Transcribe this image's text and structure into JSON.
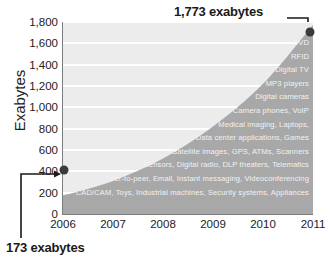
{
  "chart_data": {
    "type": "area",
    "title": "",
    "xlabel": "",
    "ylabel": "Exabytes",
    "x": [
      "2006",
      "2007",
      "2008",
      "2009",
      "2010",
      "2011"
    ],
    "categories": [
      "2006",
      "2007",
      "2008",
      "2009",
      "2010",
      "2011"
    ],
    "values": [
      173,
      310,
      520,
      820,
      1220,
      1773
    ],
    "series": [
      {
        "name": "Information created",
        "values": [
          173,
          310,
          520,
          820,
          1220,
          1773
        ]
      }
    ],
    "ylim": [
      0,
      1800
    ],
    "yticks": [
      0,
      200,
      400,
      600,
      800,
      1000,
      1200,
      1400,
      1600,
      1800
    ],
    "ytick_labels": [
      "0",
      "200",
      "400",
      "600",
      "800",
      "1,000",
      "1,200",
      "1,400",
      "1,600",
      "1,800"
    ],
    "grid": true,
    "legend": "none",
    "annotations": [
      {
        "text": "1,773 exabytes",
        "x": "2011",
        "y": 1773,
        "position": "top-right"
      },
      {
        "text": "173 exabytes",
        "x": "2006",
        "y": 173,
        "position": "bottom-left"
      }
    ],
    "inline_labels": [
      "DVD",
      "RFID",
      "Digital TV",
      "MP3 players",
      "Digital cameras",
      "Camera phones, VoIP",
      "Medical imaging, Laptops,",
      "Data center applications, Games",
      "Satellite images, GPS, ATMs, Scanners",
      "Sensors, Digital radio, DLP theaters, Telematics",
      "Peer-to-peer, Email, Instant messaging, Videoconferencing",
      "CAD/CAM, Toys, Industrial machines, Security systems, Appliances"
    ]
  },
  "colors": {
    "plot_background": "#ececed",
    "area_fill": "#a8a8a8",
    "gridline": "#ffffff",
    "axis": "#7d7d7d",
    "data_point": "#3a3a3a",
    "annotation_text": "#1a1a1a",
    "inline_label_text": "#f2f2f2"
  }
}
